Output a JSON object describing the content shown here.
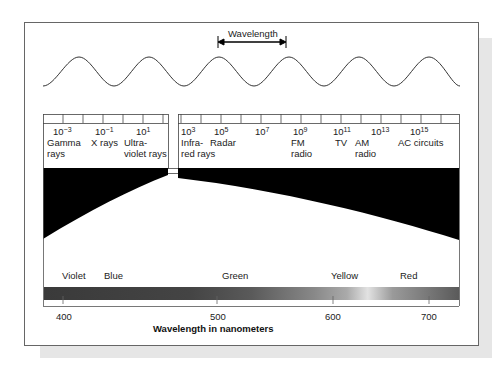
{
  "diagram": {
    "type": "electromagnetic-spectrum",
    "wavelength_label": "Wavelength",
    "scale_ticks": [
      {
        "base": "10",
        "exp": "−3",
        "label": [
          "Gamma",
          "rays"
        ]
      },
      {
        "base": "10",
        "exp": "−1",
        "label": [
          "X rays"
        ]
      },
      {
        "base": "10",
        "exp": "1",
        "label": [
          "Ultra-",
          "violet rays"
        ]
      },
      {
        "base": "10",
        "exp": "3",
        "label": [
          "Infra-",
          "red rays"
        ]
      },
      {
        "base": "10",
        "exp": "5",
        "label": [
          "Radar"
        ]
      },
      {
        "base": "10",
        "exp": "7",
        "label": []
      },
      {
        "base": "10",
        "exp": "9",
        "label": [
          "FM",
          "radio"
        ]
      },
      {
        "base": "10",
        "exp": "11",
        "label": [
          "TV"
        ]
      },
      {
        "base": "10",
        "exp": "13",
        "label": [
          "AM",
          "radio"
        ]
      },
      {
        "base": "10",
        "exp": "15",
        "label": [
          "AC circuits"
        ]
      }
    ],
    "visible_colors": [
      "Violet",
      "Blue",
      "Green",
      "Yellow",
      "Red"
    ],
    "nm_ticks": [
      "400",
      "500",
      "600",
      "700"
    ],
    "axis_title": "Wavelength in nanometers",
    "colors": {
      "band": "#000000",
      "frame": "#666666",
      "shadow": "#e6e6e6"
    }
  }
}
